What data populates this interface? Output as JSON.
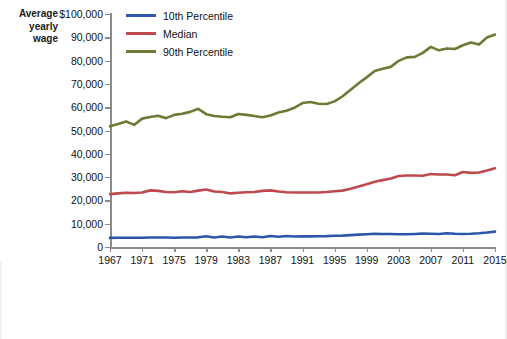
{
  "axis_caption": {
    "line1": "Average",
    "line2": "yearly",
    "line3": "wage"
  },
  "legend": {
    "position": "top-left-inside",
    "items": [
      {
        "label": "10th Percentile",
        "color": "#2E56A8",
        "swatch_icon": "line-swatch-icon"
      },
      {
        "label": "Median",
        "color": "#BE4A4E",
        "swatch_icon": "line-swatch-icon"
      },
      {
        "label": "90th Percentile",
        "color": "#6B7A35",
        "swatch_icon": "line-swatch-icon"
      }
    ]
  },
  "chart_data": {
    "type": "line",
    "title": "",
    "subtitle": "",
    "xlabel": "",
    "ylabel": "Average yearly wage",
    "xlim": [
      1967,
      2015
    ],
    "ylim": [
      0,
      100000
    ],
    "grid": false,
    "y_ticks": [
      0,
      10000,
      20000,
      30000,
      40000,
      50000,
      60000,
      70000,
      80000,
      90000,
      100000
    ],
    "y_tick_labels": [
      "0",
      "10,000",
      "20,000",
      "30,000",
      "40,000",
      "50,000",
      "60,000",
      "70,000",
      "80,000",
      "90,000",
      "$100,000"
    ],
    "x_ticks": [
      1967,
      1971,
      1975,
      1979,
      1983,
      1987,
      1991,
      1995,
      1999,
      2003,
      2007,
      2011,
      2015
    ],
    "x_tick_labels": [
      "1967",
      "1971",
      "1975",
      "1979",
      "1983",
      "1987",
      "1991",
      "1995",
      "1999",
      "2003",
      "2007",
      "2011",
      "2015"
    ],
    "x": [
      1967,
      1968,
      1969,
      1970,
      1971,
      1972,
      1973,
      1974,
      1975,
      1976,
      1977,
      1978,
      1979,
      1980,
      1981,
      1982,
      1983,
      1984,
      1985,
      1986,
      1987,
      1988,
      1989,
      1990,
      1991,
      1992,
      1993,
      1994,
      1995,
      1996,
      1997,
      1998,
      1999,
      2000,
      2001,
      2002,
      2003,
      2004,
      2005,
      2006,
      2007,
      2008,
      2009,
      2010,
      2011,
      2012,
      2013,
      2014,
      2015
    ],
    "series": [
      {
        "name": "10th Percentile",
        "color": "#2E56A8",
        "values": [
          3900,
          3950,
          4000,
          3950,
          4000,
          4050,
          4100,
          4050,
          4000,
          4050,
          4100,
          4150,
          4600,
          4100,
          4500,
          4100,
          4500,
          4150,
          4500,
          4200,
          4700,
          4400,
          4700,
          4500,
          4600,
          4550,
          4600,
          4650,
          4800,
          4900,
          5100,
          5300,
          5500,
          5700,
          5600,
          5550,
          5500,
          5450,
          5600,
          5800,
          5700,
          5600,
          5900,
          5700,
          5600,
          5700,
          5900,
          6200,
          6600
        ]
      },
      {
        "name": "Median",
        "color": "#BE4A4E",
        "values": [
          22700,
          23000,
          23300,
          23200,
          23400,
          24300,
          24100,
          23600,
          23500,
          23900,
          23600,
          24200,
          24700,
          23800,
          23600,
          23000,
          23300,
          23500,
          23600,
          24100,
          24300,
          23800,
          23500,
          23400,
          23400,
          23400,
          23400,
          23600,
          23900,
          24200,
          25000,
          26000,
          26900,
          28000,
          28700,
          29400,
          30500,
          30700,
          30700,
          30600,
          31300,
          31100,
          31100,
          30800,
          32200,
          31800,
          32000,
          32800,
          33800
        ]
      },
      {
        "name": "90th Percentile",
        "color": "#6B7A35",
        "values": [
          51800,
          52800,
          53900,
          52400,
          55100,
          55800,
          56300,
          55300,
          56700,
          57200,
          58000,
          59300,
          57000,
          56200,
          55900,
          55700,
          57100,
          56700,
          56200,
          55700,
          56400,
          57700,
          58500,
          59800,
          61800,
          62200,
          61500,
          61400,
          62500,
          64700,
          67500,
          70300,
          72800,
          75500,
          76500,
          77300,
          79900,
          81400,
          81600,
          83300,
          85900,
          84400,
          85200,
          85000,
          86600,
          87800,
          86900,
          89900,
          91200
        ]
      }
    ]
  }
}
